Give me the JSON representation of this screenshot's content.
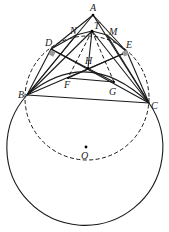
{
  "figure": {
    "points": {
      "A": {
        "label": "A",
        "x": 93,
        "y": 15
      },
      "T": {
        "label": "T",
        "x": 92,
        "y": 31
      },
      "N": {
        "label": "N",
        "x": 76,
        "y": 35
      },
      "M": {
        "label": "M",
        "x": 107,
        "y": 35
      },
      "D": {
        "label": "D",
        "x": 51,
        "y": 49
      },
      "E": {
        "label": "E",
        "x": 127,
        "y": 52
      },
      "H": {
        "label": "H",
        "x": 88,
        "y": 68
      },
      "F": {
        "label": "F",
        "x": 68,
        "y": 78
      },
      "G": {
        "label": "G",
        "x": 114,
        "y": 82
      },
      "B": {
        "label": "B",
        "x": 27,
        "y": 95
      },
      "C": {
        "label": "C",
        "x": 149,
        "y": 103
      },
      "O": {
        "label": "O",
        "x": 86,
        "y": 148
      }
    },
    "circles": {
      "dashed": {
        "cx": 87,
        "cy": 98,
        "r": 62,
        "style": "dashed"
      },
      "solid": {
        "cx": 86,
        "cy": 150,
        "r": 78,
        "style": "solid"
      }
    }
  }
}
